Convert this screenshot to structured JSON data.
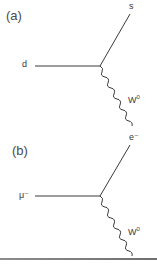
{
  "diagrams": [
    {
      "panel_label": "(a)",
      "incoming": {
        "label": "d"
      },
      "outgoing": {
        "label": "s"
      },
      "boson": {
        "base": "W",
        "superscript": "0"
      }
    },
    {
      "panel_label": "(b)",
      "incoming": {
        "label": "μ⁻"
      },
      "outgoing": {
        "label": "e⁻"
      },
      "boson": {
        "base": "W",
        "superscript": "0"
      }
    }
  ],
  "colors": {
    "line": "#3a3a3a",
    "text": "#3a3a3a",
    "divider": "#7f7f7f"
  }
}
